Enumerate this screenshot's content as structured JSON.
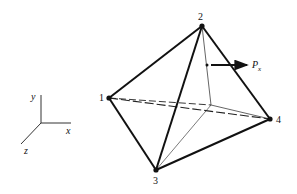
{
  "figure": {
    "nodes": [
      {
        "id": "1",
        "label": "1"
      },
      {
        "id": "2",
        "label": "2"
      },
      {
        "id": "3",
        "label": "3"
      },
      {
        "id": "4",
        "label": "4"
      }
    ],
    "load": {
      "label": "P",
      "subscript": "x"
    },
    "axes": {
      "x": "x",
      "y": "y",
      "z": "z"
    }
  }
}
